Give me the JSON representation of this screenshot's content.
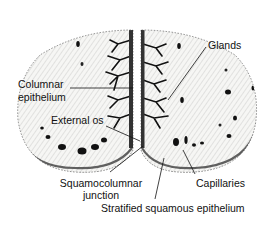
{
  "diagram": {
    "colors": {
      "ink": "#111111",
      "background": "#ffffff",
      "tissue": "#f4f4f2"
    },
    "labels": {
      "glands": "Glands",
      "columnar_line1": "Columnar",
      "columnar_line2": "epithelium",
      "external_os": "External os",
      "squamocolumnar_line1": "Squamocolumnar",
      "squamocolumnar_line2": "junction",
      "capillaries": "Capillaries",
      "stratified": "Stratified squamous epithelium"
    }
  }
}
